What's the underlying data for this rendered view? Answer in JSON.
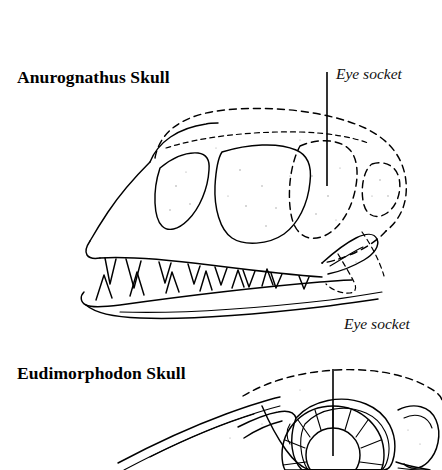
{
  "figure": {
    "kind": "scientific-line-illustration",
    "background_color": "#ffffff",
    "ink_color": "#000000",
    "width": 442,
    "height": 470
  },
  "specimens": [
    {
      "id": "anurognathus",
      "title": "Anurognathus Skull",
      "annotation": "Eye socket",
      "features": [
        "short broad skull",
        "large orbit",
        "widely spaced teeth",
        "dashed reconstructed cranium"
      ]
    },
    {
      "id": "eudimorphodon",
      "title": "Eudimorphodon Skull",
      "annotation": "Eye socket",
      "features": [
        "elongated snout",
        "sclerotic ring in orbit",
        "cropped at image bottom"
      ]
    }
  ],
  "annotations": {
    "eye_socket_label": "Eye socket"
  },
  "dentition": {
    "anurognathus_upper_teeth": 8,
    "anurognathus_lower_teeth": 6
  },
  "sclerotic_ring": {
    "plate_count": 13
  }
}
